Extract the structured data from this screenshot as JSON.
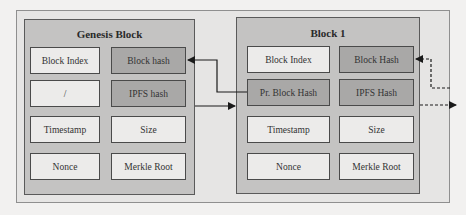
{
  "diagram": {
    "type": "blockchain-structure",
    "colors": {
      "background": "#f2f1f0",
      "frame": "#e6e5e4",
      "block_fill": "#c4c3c2",
      "cell_light": "#ecebea",
      "cell_dark": "#a9a8a7",
      "line": "#1a1a1a"
    },
    "blocks": [
      {
        "title": "Genesis Block",
        "cells": [
          {
            "label": "Block Index",
            "shade": "light"
          },
          {
            "label": "Block hash",
            "shade": "dark"
          },
          {
            "label": "/",
            "shade": "light"
          },
          {
            "label": "IPFS hash",
            "shade": "dark"
          },
          {
            "label": "Timestamp",
            "shade": "light"
          },
          {
            "label": "Size",
            "shade": "light"
          },
          {
            "label": "Nonce",
            "shade": "light"
          },
          {
            "label": "Merkle Root",
            "shade": "light"
          }
        ]
      },
      {
        "title": "Block 1",
        "cells": [
          {
            "label": "Block Index",
            "shade": "light"
          },
          {
            "label": "Block Hash",
            "shade": "dark"
          },
          {
            "label": "Pr. Block Hash",
            "shade": "dark"
          },
          {
            "label": "IPFS Hash",
            "shade": "dark"
          },
          {
            "label": "Timestamp",
            "shade": "light"
          },
          {
            "label": "Size",
            "shade": "light"
          },
          {
            "label": "Nonce",
            "shade": "light"
          },
          {
            "label": "Merkle Root",
            "shade": "light"
          }
        ]
      }
    ],
    "connections": [
      {
        "from": "Block 1 / Pr. Block Hash",
        "to": "Genesis Block / Block hash",
        "style": "solid"
      },
      {
        "from": "Genesis Block / IPFS hash",
        "to": "Block 1",
        "style": "solid"
      },
      {
        "from": "next block",
        "to": "Block 1 / Block Hash",
        "style": "dashed"
      },
      {
        "from": "Block 1 / IPFS Hash",
        "to": "next block",
        "style": "dashed"
      }
    ]
  }
}
